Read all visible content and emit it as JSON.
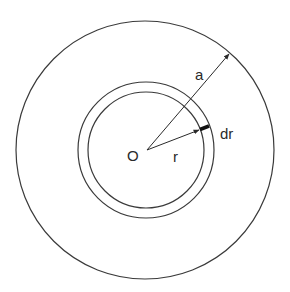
{
  "diagram": {
    "title": "",
    "colors": {
      "stroke": "#3a3a3a",
      "background": "#ffffff",
      "text": "#2a2a2a"
    },
    "center": {
      "label": "O",
      "x": 147,
      "y": 150
    },
    "circles": [
      {
        "name": "outer",
        "r": 130
      },
      {
        "name": "shell-inner",
        "r": 58
      },
      {
        "name": "shell-outer",
        "r": 68
      }
    ],
    "labels": {
      "radius_a": "a",
      "radius_r": "r",
      "thickness_dr": "dr",
      "origin": "O"
    }
  }
}
